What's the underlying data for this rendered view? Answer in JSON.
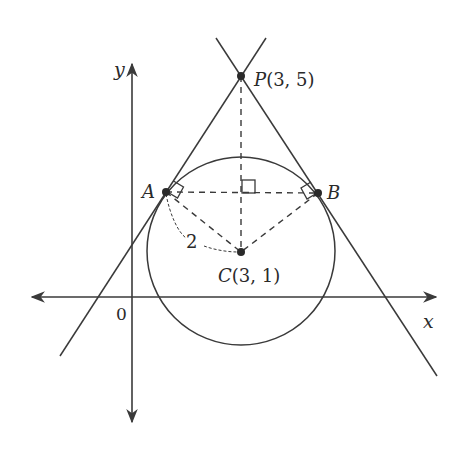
{
  "diagram": {
    "colors": {
      "ink": "#3a3a3a",
      "background": "#ffffff"
    },
    "axes": {
      "x_label": "x",
      "y_label": "y",
      "origin_label": "0"
    },
    "points": {
      "P": {
        "name": "P",
        "coords_label": "(3, 5)",
        "label": "P(3,5)"
      },
      "C": {
        "name": "C",
        "coords_label": "(3, 1)",
        "label": "C(3,1)"
      },
      "A": {
        "name": "A",
        "label": "A"
      },
      "B": {
        "name": "B",
        "label": "B"
      }
    },
    "circle": {
      "center": "C",
      "radius_label": "2"
    },
    "annotations": {
      "radius_length": "2",
      "right_angle_markers": [
        "A",
        "B",
        "foot of PC on AB"
      ]
    }
  }
}
